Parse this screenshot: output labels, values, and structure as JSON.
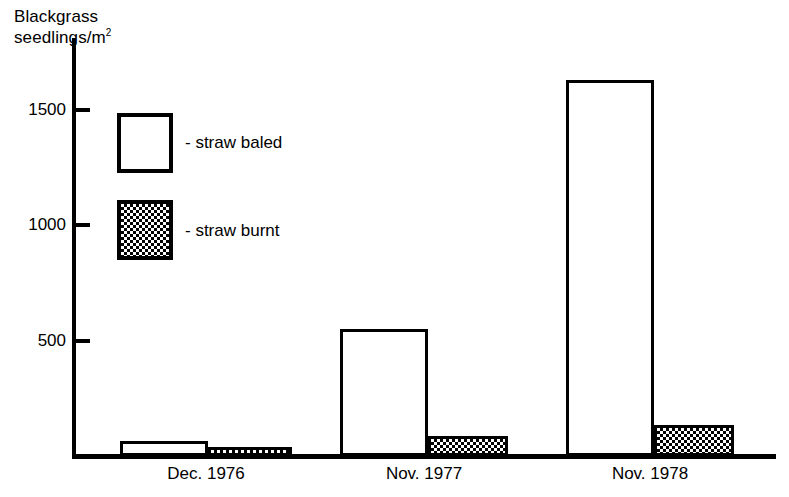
{
  "chart_data": {
    "type": "bar",
    "title": "",
    "ylabel_line1": "Blackgrass",
    "ylabel_line2": "seedlings/m",
    "ylabel_sup": "2",
    "xlabel": "",
    "categories": [
      "Dec. 1976",
      "Nov. 1977",
      "Nov. 1978"
    ],
    "series": [
      {
        "name": "straw baled",
        "values": [
          65,
          550,
          1630
        ]
      },
      {
        "name": "straw burnt",
        "values": [
          40,
          85,
          135
        ]
      }
    ],
    "ylim": [
      0,
      1800
    ],
    "yticks": [
      500,
      1000,
      1500
    ],
    "ytick_labels": [
      "500",
      "1000",
      "1500"
    ],
    "grid": false,
    "legend_position": "upper-left-inside",
    "colors": {
      "baled": "#ffffff",
      "burnt": "#000000",
      "axis": "#000000"
    }
  },
  "legend": {
    "items": [
      {
        "dash": "-",
        "label": "straw baled",
        "style": "open"
      },
      {
        "dash": "-",
        "label": "straw burnt",
        "style": "checkered"
      }
    ]
  }
}
